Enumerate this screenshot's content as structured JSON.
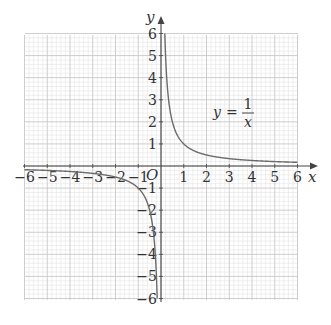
{
  "chart_data": {
    "type": "line",
    "title": "",
    "function": "y = 1/x",
    "xlabel": "x",
    "ylabel": "y",
    "origin_label": "O",
    "xlim": [
      -6,
      6
    ],
    "ylim": [
      -6,
      6
    ],
    "grid": true,
    "minor_grid_per_unit": 5,
    "x_ticks": [
      -6,
      -5,
      -4,
      -3,
      -2,
      -1,
      1,
      2,
      3,
      4,
      5,
      6
    ],
    "y_ticks": [
      -6,
      -5,
      -4,
      -3,
      -2,
      -1,
      1,
      2,
      3,
      4,
      5,
      6
    ],
    "annotation": {
      "text": "y = 1/x",
      "numerator": "1",
      "denominator": "x",
      "lhs": "y",
      "position": [
        3.0,
        2.0
      ]
    },
    "series": [
      {
        "name": "y = 1/x (x > 0)",
        "x": [
          0.1667,
          0.2,
          0.25,
          0.3333,
          0.5,
          0.75,
          1,
          1.5,
          2,
          3,
          4,
          5,
          6
        ],
        "y": [
          6,
          5,
          4,
          3,
          2,
          1.3333,
          1,
          0.6667,
          0.5,
          0.3333,
          0.25,
          0.2,
          0.1667
        ]
      },
      {
        "name": "y = 1/x (x < 0)",
        "x": [
          -6,
          -5,
          -4,
          -3,
          -2,
          -1.5,
          -1,
          -0.75,
          -0.5,
          -0.3333,
          -0.25,
          -0.2,
          -0.1667
        ],
        "y": [
          -0.1667,
          -0.2,
          -0.25,
          -0.3333,
          -0.5,
          -0.6667,
          -1,
          -1.3333,
          -2,
          -3,
          -4,
          -5,
          -6
        ]
      }
    ]
  },
  "colors": {
    "curve": "#6b6b6b",
    "axis": "#444444",
    "major_grid": "#c8c8c8",
    "minor_grid": "#e4e4e4",
    "text": "#333333"
  }
}
